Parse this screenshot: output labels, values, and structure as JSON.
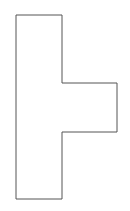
{
  "diagram": {
    "type": "polygon-outline",
    "shape": "t-shape-rotated",
    "stroke_color": "#555555",
    "fill_color": "#ffffff",
    "points": "16,15 62,15 62,83 117,83 117,132 62,132 62,199 16,199"
  }
}
